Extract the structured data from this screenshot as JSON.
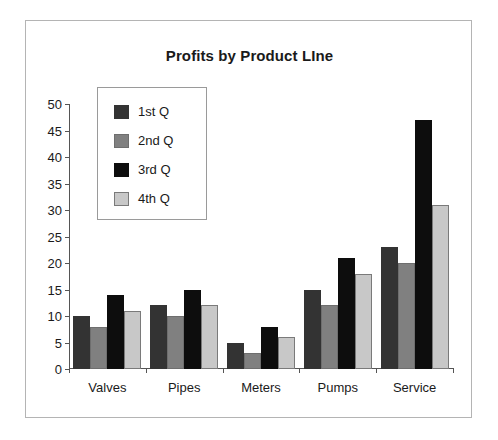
{
  "chart_data": {
    "type": "bar",
    "title": "Profits by Product LIne",
    "xlabel": "",
    "ylabel": "",
    "ylim": [
      0,
      50
    ],
    "yticks": [
      0,
      5,
      10,
      15,
      20,
      25,
      30,
      35,
      40,
      45,
      50
    ],
    "grid": false,
    "legend_position": "upper-left-inset",
    "categories": [
      "Valves",
      "Pipes",
      "Meters",
      "Pumps",
      "Service"
    ],
    "series": [
      {
        "name": "1st Q",
        "color": "#333333",
        "values": [
          10,
          12,
          5,
          15,
          23
        ]
      },
      {
        "name": "2nd Q",
        "color": "#808080",
        "values": [
          8,
          10,
          3,
          12,
          20
        ]
      },
      {
        "name": "3rd Q",
        "color": "#0d0d0d",
        "values": [
          14,
          15,
          8,
          21,
          47
        ]
      },
      {
        "name": "4th Q",
        "color": "#c8c8c8",
        "values": [
          11,
          12,
          6,
          18,
          31
        ]
      }
    ]
  },
  "frame": {
    "border_color": "#b4b4b4",
    "background": "#ffffff"
  }
}
